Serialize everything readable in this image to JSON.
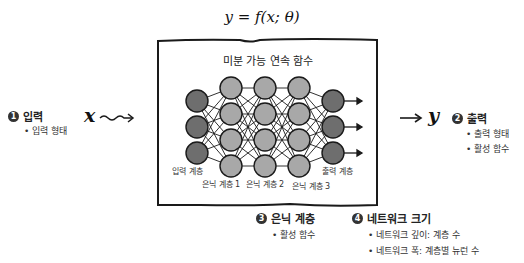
{
  "formula": "y = f(x; θ)",
  "function_box": {
    "title": "미분 가능 연속 함수"
  },
  "input": {
    "number": "1",
    "title": "입력",
    "bullets": [
      "입력 형태"
    ],
    "variable": "x"
  },
  "output": {
    "number": "2",
    "title": "출력",
    "bullets": [
      "출력 형태",
      "활성 함수"
    ],
    "variable": "y"
  },
  "hidden": {
    "number": "3",
    "title": "은닉 계층",
    "bullets": [
      "활성 함수"
    ]
  },
  "network_size": {
    "number": "4",
    "title": "네트워크 크기",
    "bullets": [
      "네트워크 깊이: 계층 수",
      "네트워크 폭: 계층별 뉴런 수"
    ]
  },
  "layer_labels": {
    "input": "입력 계층",
    "hidden1": "은닉 계층 1",
    "hidden2": "은닉 계층 2",
    "hidden3": "은닉 계층 3",
    "output": "출력 계층"
  },
  "network": {
    "layers": [
      3,
      4,
      4,
      4,
      3
    ],
    "colors": {
      "io_node": "#6e6e6e",
      "hidden_node": "#a8a8a8",
      "stroke": "#1a1a1a"
    }
  }
}
